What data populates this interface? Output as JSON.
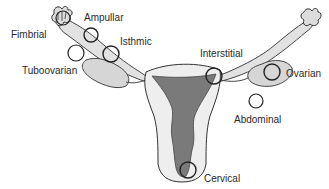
{
  "labels": {
    "fimbrial": "Fimbrial",
    "ampullar": "Ampullar",
    "isthmic": "Isthmic",
    "tuboovarian": "Tuboovarian",
    "interstitial": "Interstitial",
    "ovarian": "Ovarian",
    "abdominal": "Abdominal",
    "cervical": "Cervical"
  },
  "colors": {
    "outline": "#333333",
    "fill_light": "#e6e6e6",
    "fill_organ": "#d4d4d4",
    "cavity": "#7a7a7a",
    "background": "#ffffff"
  }
}
